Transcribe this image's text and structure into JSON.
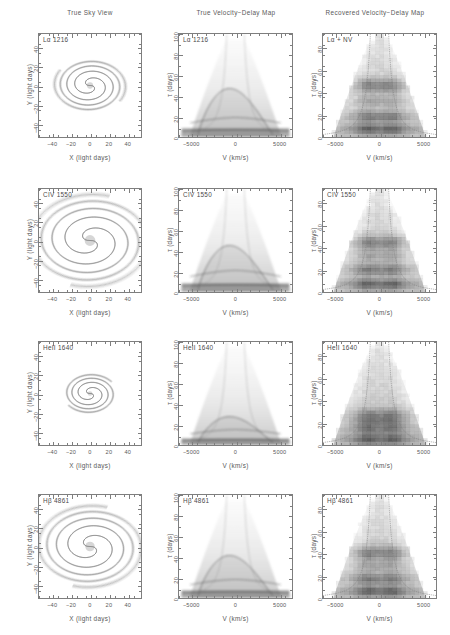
{
  "figure": {
    "width": 450,
    "height": 635,
    "background": "#ffffff",
    "ink": "#4a4a4a"
  },
  "columns": [
    {
      "id": "sky",
      "header": "True Sky View"
    },
    {
      "id": "true_map",
      "header": "True Velocity−Delay Map"
    },
    {
      "id": "recovered",
      "header": "Recovered Velocity−Delay Map"
    }
  ],
  "axes": {
    "sky": {
      "xlabel": "X (light days)",
      "ylabel": "Y (light days)",
      "xticks": [
        -40,
        -20,
        0,
        20,
        40
      ],
      "xticklabels": [
        "−40",
        "−20",
        "0",
        "20",
        "40"
      ],
      "yticks": [
        -40,
        -20,
        0,
        20,
        40
      ],
      "yticklabels": [
        "−40",
        "−20",
        "0",
        "20",
        "40"
      ],
      "xlim": [
        -55,
        55
      ],
      "ylim": [
        -55,
        55
      ]
    },
    "map_true": {
      "xlabel": "V (km/s)",
      "ylabel": "τ (days)",
      "xticks": [
        -5000,
        0,
        5000
      ],
      "xticklabels": [
        "−5000",
        "0",
        "5000"
      ],
      "yticks": [
        0,
        20,
        40,
        60,
        80,
        100
      ],
      "yticklabels": [
        "0",
        "20",
        "40",
        "60",
        "80",
        "100"
      ],
      "xlim": [
        -6500,
        6500
      ],
      "ylim": [
        0,
        100
      ]
    },
    "map_recovered": {
      "xlabel": "V (km/s)",
      "ylabel": "τ (days)",
      "xticks": [
        -5000,
        0,
        5000
      ],
      "xticklabels": [
        "−5000",
        "0",
        "5000"
      ],
      "yticks": [
        0,
        20,
        40,
        60,
        80
      ],
      "yticklabels": [
        "0",
        "20",
        "40",
        "60",
        "80"
      ],
      "xlim": [
        -6500,
        6500
      ],
      "ylim": [
        0,
        92
      ]
    }
  },
  "rows": [
    {
      "id": "lya",
      "sky_label": "Lα 1216",
      "true_label": "Lα 1216",
      "recovered_label": "Lα + NV",
      "spiral_scale": 0.3,
      "spiral_turns": 2.1,
      "response_peak_delay": 46,
      "response_lag_band": 18,
      "response_floor_band": 7
    },
    {
      "id": "civ",
      "sky_label": "CIV 1550",
      "true_label": "CIV 1550",
      "recovered_label": "CIV 1550",
      "spiral_scale": 0.52,
      "spiral_turns": 2.3,
      "response_peak_delay": 44,
      "response_lag_band": 20,
      "response_floor_band": 7
    },
    {
      "id": "heii",
      "sky_label": "HeII 1640",
      "true_label": "HeII 1640",
      "recovered_label": "HeII 1640",
      "spiral_scale": 0.22,
      "spiral_turns": 1.9,
      "response_peak_delay": 26,
      "response_lag_band": 14,
      "response_floor_band": 5
    },
    {
      "id": "hbeta",
      "sky_label": "Hβ 4861",
      "true_label": "Hβ 4861",
      "recovered_label": "Hβ 4861",
      "spiral_scale": 0.46,
      "spiral_turns": 2.3,
      "response_peak_delay": 40,
      "response_lag_band": 17,
      "response_floor_band": 6
    }
  ],
  "chart_data": {
    "type": "heatmap",
    "title": "",
    "grid": false,
    "legend_position": "none",
    "panel_grid": {
      "rows": 4,
      "cols": 3
    },
    "colormap": "grayscale (white = 0, black = max response)",
    "overlay": {
      "name": "virial envelope",
      "style": "dotted",
      "equation": "τ = (c·?)  V ∝ τ^(−1/2)",
      "description": "Dotted curves mark the virial envelope V = ±(GM/cτ)^(1/2) bounding a Keplerian disk"
    },
    "xlabel": "V (km/s)",
    "ylabel": "τ (days)",
    "xticklabels": [
      "−5000",
      "0",
      "5000"
    ],
    "yticklabels_true": [
      "0",
      "20",
      "40",
      "60",
      "80",
      "100"
    ],
    "yticklabels_recovered": [
      "0",
      "20",
      "40",
      "60",
      "80"
    ],
    "xlim": [
      -6500,
      6500
    ],
    "ylim_true": [
      0,
      100
    ],
    "ylim_recovered": [
      0,
      92
    ],
    "series": [
      {
        "name": "Lα 1216",
        "panel": "true_map",
        "peak_delay_days": 46,
        "secondary_band_days": 18,
        "base_band_days": 7,
        "fwhm_velocity_kms": 4200,
        "virial_envelope_kms_at_10d": 5200
      },
      {
        "name": "Lα + NV",
        "panel": "recovered",
        "peak_delay_days": 44,
        "secondary_band_days": 18,
        "base_band_days": 8,
        "fwhm_velocity_kms": 4600
      },
      {
        "name": "CIV 1550",
        "panel": "true_map",
        "peak_delay_days": 44,
        "secondary_band_days": 20,
        "base_band_days": 7,
        "fwhm_velocity_kms": 4400
      },
      {
        "name": "CIV 1550",
        "panel": "recovered",
        "peak_delay_days": 42,
        "secondary_band_days": 20,
        "base_band_days": 8,
        "fwhm_velocity_kms": 4800
      },
      {
        "name": "HeII 1640",
        "panel": "true_map",
        "peak_delay_days": 26,
        "secondary_band_days": 14,
        "base_band_days": 5,
        "fwhm_velocity_kms": 4000
      },
      {
        "name": "HeII 1640",
        "panel": "recovered",
        "peak_delay_days": 24,
        "secondary_band_days": 14,
        "base_band_days": 6,
        "fwhm_velocity_kms": 4400
      },
      {
        "name": "Hβ 4861",
        "panel": "true_map",
        "peak_delay_days": 40,
        "secondary_band_days": 17,
        "base_band_days": 6,
        "fwhm_velocity_kms": 4200
      },
      {
        "name": "Hβ 4861",
        "panel": "recovered",
        "peak_delay_days": 40,
        "secondary_band_days": 17,
        "base_band_days": 7,
        "fwhm_velocity_kms": 4600
      }
    ],
    "sky_panels": [
      {
        "name": "Lα 1216",
        "structure": "two-armed spiral",
        "radial_extent_ld": 14
      },
      {
        "name": "CIV 1550",
        "structure": "two-armed spiral",
        "radial_extent_ld": 26
      },
      {
        "name": "HeII 1640",
        "structure": "two-armed spiral",
        "radial_extent_ld": 10
      },
      {
        "name": "Hβ 4861",
        "structure": "two-armed spiral",
        "radial_extent_ld": 23
      }
    ]
  }
}
